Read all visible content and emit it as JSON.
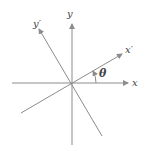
{
  "diagram": {
    "axes": {
      "x_label": "x",
      "y_label": "y",
      "x_prime_label": "x′",
      "y_prime_label": "y′"
    },
    "angle_label": "θ",
    "colors": {
      "line": "#8c8c8c",
      "text": "#444444",
      "background": "#ffffff"
    }
  }
}
